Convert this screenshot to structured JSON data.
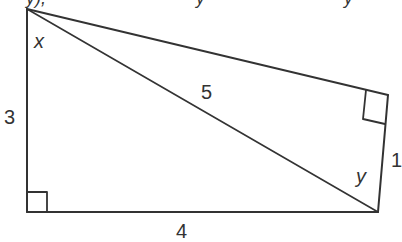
{
  "diagram": {
    "type": "geometry-figure",
    "top_text_fragment": "y), ... y ... y",
    "labels": {
      "left_side": "3",
      "bottom_side": "4",
      "diagonal": "5",
      "right_side": "1",
      "angle_top_left": "x",
      "angle_bottom_right": "y"
    },
    "points": {
      "top_left": [
        27,
        9
      ],
      "bottom_left": [
        27,
        212
      ],
      "bottom_right": [
        378,
        212
      ],
      "right_corner": [
        388,
        95
      ]
    },
    "colors": {
      "stroke": "#333333",
      "background": "#ffffff"
    }
  }
}
